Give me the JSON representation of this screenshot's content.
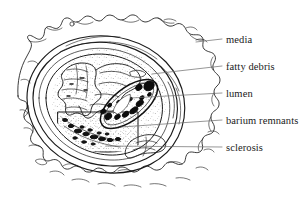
{
  "figure": {
    "kind": "histology-cross-section",
    "width": 305,
    "height": 198,
    "background_color": "#ffffff",
    "ink_color": "#1a1a1a"
  },
  "labels": [
    {
      "id": "media",
      "text": "media",
      "x": 226,
      "y": 35,
      "leader_from_x": 196,
      "leader_from_y": 42,
      "leader_to_x": 222,
      "leader_to_y": 40
    },
    {
      "id": "fatty",
      "text": "fatty debris",
      "x": 226,
      "y": 62,
      "leader_from_x": 152,
      "leader_from_y": 74,
      "leader_to_x": 222,
      "leader_to_y": 67
    },
    {
      "id": "lumen",
      "text": "lumen",
      "x": 226,
      "y": 89,
      "leader_from_x": 131,
      "leader_from_y": 98,
      "leader_to_x": 222,
      "leader_to_y": 94
    },
    {
      "id": "barium",
      "text": "barium remnants",
      "x": 226,
      "y": 116,
      "leader_from_x": 121,
      "leader_from_y": 127,
      "leader_to_x": 222,
      "leader_to_y": 121
    },
    {
      "id": "sclerosis",
      "text": "sclerosis",
      "x": 226,
      "y": 143,
      "leader_from_x": 106,
      "leader_from_y": 146,
      "leader_to_x": 222,
      "leader_to_y": 148
    }
  ]
}
